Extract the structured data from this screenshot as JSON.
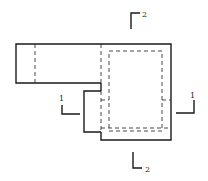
{
  "drawing": {
    "type": "orthographic plan view with section markers",
    "stroke_color": "#1a1a1a",
    "background": "#ffffff"
  },
  "section_markers": {
    "top": {
      "label": "2"
    },
    "bottom": {
      "label": "2"
    },
    "left": {
      "label": "1"
    },
    "right": {
      "label": "1"
    }
  }
}
